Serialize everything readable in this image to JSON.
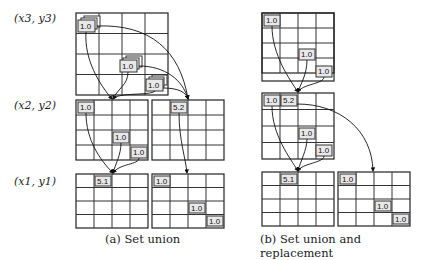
{
  "row_labels": [
    "(x3, y3)",
    "(x2, y2)",
    "(x1, y1)"
  ],
  "captions": {
    "a": "(a) Set union",
    "b": "(b) Set union and replacement"
  },
  "panel_a": {
    "level3": {
      "grid": "4x4",
      "entries": [
        {
          "pos": "r0c0",
          "value": "1.0"
        },
        {
          "pos": "r2c2",
          "value": "1.0"
        },
        {
          "pos": "r3c3",
          "value": "1.0"
        }
      ],
      "stacked": true
    },
    "level2": [
      {
        "grid": "4x4",
        "entries": [
          {
            "pos": "r0c0",
            "value": "1.0"
          },
          {
            "pos": "r2c2",
            "value": "1.0"
          },
          {
            "pos": "r3c3",
            "value": "1.0"
          }
        ]
      },
      {
        "grid": "4x4",
        "entries": [
          {
            "pos": "r0c1",
            "value": "5.2"
          }
        ]
      }
    ],
    "level1": [
      {
        "grid": "4x4",
        "entries": [
          {
            "pos": "r0c1",
            "value": "5.1"
          }
        ]
      },
      {
        "grid": "4x4",
        "entries": [
          {
            "pos": "r0c0",
            "value": "1.0"
          },
          {
            "pos": "r2c2",
            "value": "1.0"
          },
          {
            "pos": "r3c3",
            "value": "1.0"
          }
        ]
      }
    ]
  },
  "panel_b": {
    "level3": {
      "grid": "4x4",
      "entries": [
        {
          "pos": "r0c0",
          "value": "1.0"
        },
        {
          "pos": "r2c2",
          "value": "1.0"
        },
        {
          "pos": "r3c3",
          "value": "1.0"
        }
      ]
    },
    "level2": {
      "grid": "4x4",
      "entries": [
        {
          "pos": "r0c0",
          "value": "1.0"
        },
        {
          "pos": "r0c1",
          "value": "5.2"
        },
        {
          "pos": "r2c2",
          "value": "1.0"
        },
        {
          "pos": "r3c3",
          "value": "1.0"
        }
      ]
    },
    "level1": [
      {
        "grid": "4x4",
        "entries": [
          {
            "pos": "r0c1",
            "value": "5.1"
          }
        ]
      },
      {
        "grid": "4x4",
        "entries": [
          {
            "pos": "r0c0",
            "value": "1.0"
          },
          {
            "pos": "r2c2",
            "value": "1.0"
          },
          {
            "pos": "r3c3",
            "value": "1.0"
          }
        ]
      }
    ]
  },
  "values": {
    "one": "1.0",
    "a": "5.1",
    "b": "5.2"
  }
}
